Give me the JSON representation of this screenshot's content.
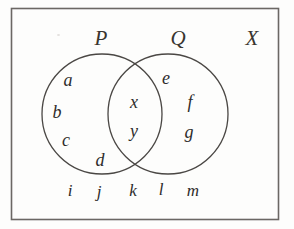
{
  "diagram": {
    "type": "venn-2-set",
    "universe": {
      "label": "X",
      "shape": "rectangle",
      "x": 11,
      "y": 8,
      "width": 267,
      "height": 212,
      "label_x": 252,
      "label_y": 38
    },
    "sets": [
      {
        "id": "P",
        "label": "P",
        "shape": "circle",
        "cx": 102,
        "cy": 114,
        "r": 60,
        "label_x": 101,
        "label_y": 38
      },
      {
        "id": "Q",
        "label": "Q",
        "shape": "circle",
        "cx": 168,
        "cy": 114,
        "r": 60,
        "label_x": 178,
        "label_y": 38
      }
    ],
    "regions": {
      "p_only": [
        "a",
        "b",
        "c",
        "d"
      ],
      "intersection": [
        "x",
        "y"
      ],
      "q_only": [
        "e",
        "f",
        "g"
      ],
      "outside": [
        "i",
        "j",
        "k",
        "l",
        "m"
      ]
    },
    "elements": [
      {
        "text": "a",
        "x": 68,
        "y": 80,
        "region": "p_only"
      },
      {
        "text": "b",
        "x": 57,
        "y": 112,
        "region": "p_only"
      },
      {
        "text": "c",
        "x": 66,
        "y": 140,
        "region": "p_only"
      },
      {
        "text": "d",
        "x": 100,
        "y": 160,
        "region": "p_only"
      },
      {
        "text": "x",
        "x": 134,
        "y": 102,
        "region": "intersection"
      },
      {
        "text": "y",
        "x": 134,
        "y": 131,
        "region": "intersection"
      },
      {
        "text": "e",
        "x": 166,
        "y": 78,
        "region": "q_only"
      },
      {
        "text": "f",
        "x": 190,
        "y": 102,
        "region": "q_only"
      },
      {
        "text": "g",
        "x": 189,
        "y": 132,
        "region": "q_only"
      },
      {
        "text": "i",
        "x": 70,
        "y": 190,
        "region": "outside"
      },
      {
        "text": "j",
        "x": 99,
        "y": 191,
        "region": "outside"
      },
      {
        "text": "k",
        "x": 133,
        "y": 190,
        "region": "outside"
      },
      {
        "text": "l",
        "x": 161,
        "y": 189,
        "region": "outside"
      },
      {
        "text": "m",
        "x": 193,
        "y": 190,
        "region": "outside"
      }
    ],
    "colors": {
      "ink": "#2e2c2b",
      "stroke": "#4a4744",
      "background": "#fdfdfc"
    }
  }
}
